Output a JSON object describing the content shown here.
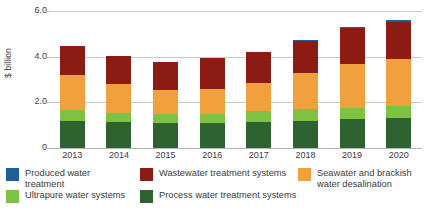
{
  "chart_data": {
    "type": "bar",
    "subtype": "stacked-vertical",
    "title": "",
    "xlabel": "",
    "ylabel": "$ billion",
    "categories": [
      "2013",
      "2014",
      "2015",
      "2016",
      "2017",
      "2018",
      "2019",
      "2020"
    ],
    "ylim": [
      0,
      6.0
    ],
    "yticks": [
      0,
      2.0,
      4.0,
      6.0
    ],
    "ytick_labels": [
      "0",
      "2.0",
      "4.0",
      "6.0"
    ],
    "grid": "horizontal",
    "legend_position": "bottom",
    "units": "$ billion",
    "series": [
      {
        "name": "Process water treatment systems",
        "color": "#2e6230",
        "values": [
          1.2,
          1.15,
          1.1,
          1.1,
          1.15,
          1.2,
          1.25,
          1.3
        ]
      },
      {
        "name": "Ultrapure water systems",
        "color": "#7dc242",
        "values": [
          0.45,
          0.4,
          0.4,
          0.4,
          0.45,
          0.5,
          0.5,
          0.55
        ]
      },
      {
        "name": "Seawater and brackish water desalination",
        "color": "#f0a03c",
        "values": [
          1.55,
          1.25,
          1.05,
          1.1,
          1.25,
          1.6,
          1.95,
          2.05
        ]
      },
      {
        "name": "Wastewater treatment systems",
        "color": "#8c1c13",
        "values": [
          1.25,
          1.25,
          1.2,
          1.35,
          1.35,
          1.4,
          1.55,
          1.6
        ]
      },
      {
        "name": "Produced water treatment",
        "color": "#1f5f99",
        "values": [
          0.0,
          0.0,
          0.0,
          0.0,
          0.0,
          0.05,
          0.05,
          0.1
        ]
      }
    ],
    "totals": [
      4.45,
      4.05,
      3.75,
      3.95,
      4.2,
      4.75,
      5.3,
      5.6
    ]
  },
  "legend": {
    "items": [
      {
        "label": "Produced water treatment",
        "color": "#1f5f99"
      },
      {
        "label": "Wastewater treatment systems",
        "color": "#8c1c13"
      },
      {
        "label": "Seawater and brackish water desalination",
        "color": "#f0a03c"
      },
      {
        "label": "Ultrapure water systems",
        "color": "#7dc242"
      },
      {
        "label": "Process water treatment systems",
        "color": "#2e6230"
      }
    ]
  },
  "colors": {
    "produced_water": "#1f5f99",
    "wastewater": "#8c1c13",
    "desalination": "#f0a03c",
    "ultrapure": "#7dc242",
    "process_water": "#2e6230",
    "gridline": "#c9c9c9",
    "text": "#3b3b3b",
    "background": "#ffffff"
  }
}
